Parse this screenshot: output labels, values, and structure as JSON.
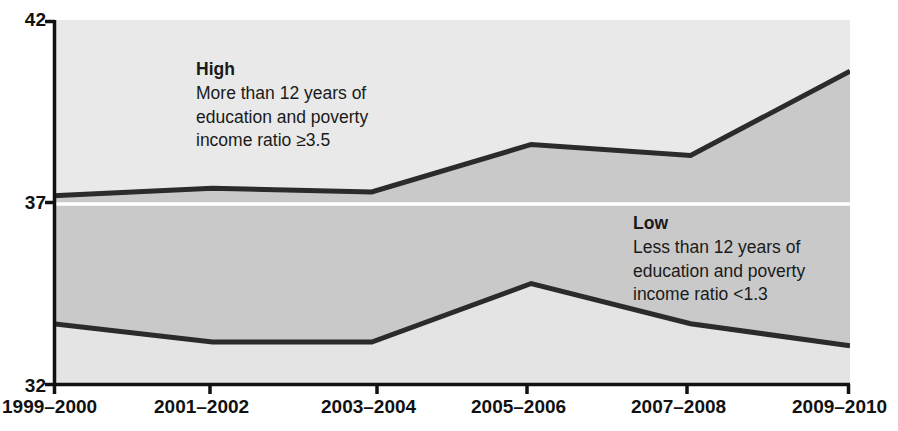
{
  "chart_data": {
    "type": "line",
    "title": "",
    "subtitle": "",
    "xlabel": "",
    "ylabel": "",
    "grid": false,
    "legend_position": "inline-annotations",
    "categories": [
      "1999–2000",
      "2001–2002",
      "2003–2004",
      "2005–2006",
      "2007–2008",
      "2009–2010"
    ],
    "x_tick_labels": [
      "1999–2000",
      "2001–2002",
      "2003–2004",
      "2005–2006",
      "2007–2008",
      "2009–2010"
    ],
    "y_tick_labels": [
      "42",
      "37",
      "32"
    ],
    "y_ticks": [
      42,
      37,
      32
    ],
    "ylim": [
      32,
      42
    ],
    "reference_line": {
      "value": 37,
      "color": "#ffffff",
      "label": "37"
    },
    "series": [
      {
        "name": "High",
        "annotation_title": "High",
        "annotation_lines": [
          "More than 12 years of",
          "education and poverty",
          "income ratio ≥3.5"
        ],
        "color": "#2b2b2b",
        "values": [
          37.2,
          37.4,
          37.3,
          38.6,
          38.3,
          40.6
        ]
      },
      {
        "name": "Low",
        "annotation_title": "Low",
        "annotation_lines": [
          "Less than 12 years of",
          "education and poverty",
          "income ratio <1.3"
        ],
        "color": "#2b2b2b",
        "values": [
          33.7,
          33.2,
          33.2,
          34.8,
          33.7,
          33.1
        ]
      }
    ],
    "colors": {
      "band_fill": "#c9c9c9",
      "upper_fill": "#e9e9e9",
      "lower_fill": "#e4e4e4",
      "line": "#2b2b2b",
      "axis": "#111111",
      "reference_line": "#ffffff",
      "text": "#111111",
      "background": "#ffffff"
    },
    "plot_area": {
      "left": 53,
      "right": 850,
      "top": 20,
      "bottom": 386
    }
  },
  "axis": {
    "y_top": "42",
    "y_mid": "37",
    "y_bottom": "32"
  },
  "annotations": {
    "high": {
      "title": "High",
      "line1": "More than 12 years of",
      "line2": "education and poverty",
      "line3": "income ratio ≥3.5"
    },
    "low": {
      "title": "Low",
      "line1": "Less than 12 years of",
      "line2": "education and poverty",
      "line3": "income ratio <1.3"
    }
  },
  "x_labels": {
    "t0": "1999–2000",
    "t1": "2001–2002",
    "t2": "2003–2004",
    "t3": "2005–2006",
    "t4": "2007–2008",
    "t5": "2009–2010"
  }
}
